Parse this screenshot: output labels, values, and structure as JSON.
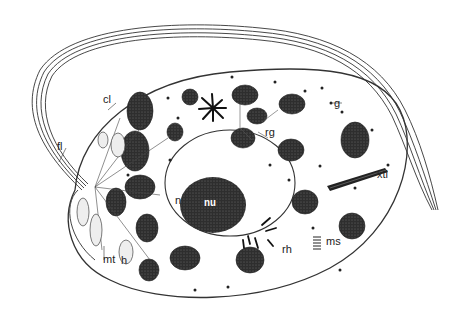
{
  "figure": {
    "colors": {
      "ink": "#222222",
      "organelle_fill": "#3a3a3a",
      "background": "#ffffff"
    }
  },
  "labels": {
    "cl": "cl",
    "fl": "fl",
    "g": "g",
    "rg": "rg",
    "xtl": "xtl",
    "n": "n",
    "nu": "nu",
    "mt": "mt",
    "h": "h",
    "rh": "rh",
    "ms": "ms"
  }
}
